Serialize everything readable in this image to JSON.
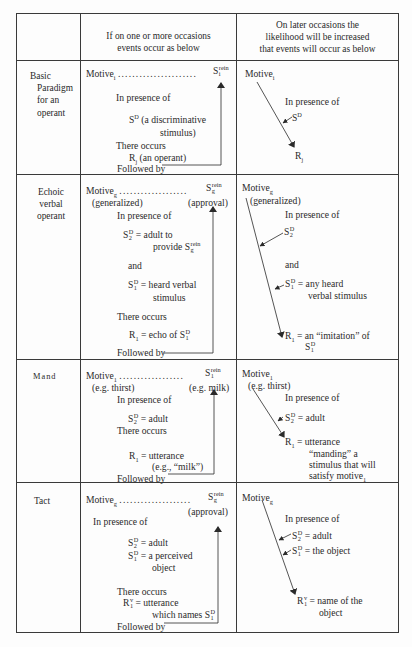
{
  "header": {
    "col1": "",
    "col2": [
      "If on one or more occasions",
      "events occur as below"
    ],
    "col3": [
      "On later occasions the",
      "likelihood will be increased",
      "that events will occur as below"
    ]
  },
  "rows": [
    {
      "label": [
        "Basic",
        "Paradigm",
        "for an",
        "operant"
      ],
      "left": {
        "motive": "Motive",
        "motive_sub": "i",
        "dots": "......................",
        "reinforcer": "S",
        "reinforcer_sup": "rein",
        "reinforcer_sub": "i",
        "in_presence": "In presence of",
        "sd": "S",
        "sd_sup": "D",
        "sd_desc_1": "(a discriminative",
        "sd_desc_2": "stimulus)",
        "there_occurs": "There occurs",
        "r": "R",
        "r_sub": "j",
        "r_desc": "(an operant)",
        "followed_by": "Followed by"
      },
      "right": {
        "motive": "Motive",
        "motive_sub": "i",
        "in_presence": "In presence of",
        "sd": "S",
        "sd_sup": "D",
        "r": "R",
        "r_sub": "j"
      }
    },
    {
      "label": [
        "Echoic",
        "verbal",
        "operant"
      ],
      "left": {
        "motive": "Motive",
        "motive_sub": "g",
        "motive_note": "(generalized)",
        "dots": "...................",
        "reinforcer": "S",
        "reinforcer_sup": "rein",
        "reinforcer_sub": "g",
        "reinforcer_note": "(approval)",
        "in_presence": "In presence of",
        "s2": "S",
        "s2_sup": "D",
        "s2_sub": "2",
        "s2_desc_1": "= adult to",
        "s2_desc_2": "provide S",
        "s2_desc_2_sup": "rein",
        "s2_desc_2_sub": "g",
        "and": "and",
        "s1": "S",
        "s1_sup": "D",
        "s1_sub": "1",
        "s1_desc_1": "= heard verbal",
        "s1_desc_2": "stimulus",
        "there_occurs": "There occurs",
        "r": "R",
        "r_sub": "1",
        "r_desc": "= echo of S",
        "r_desc_sup": "D",
        "r_desc_sub": "1",
        "followed_by": "Followed by"
      },
      "right": {
        "motive": "Motive",
        "motive_sub": "g",
        "motive_note": "(generalized)",
        "in_presence": "In presence of",
        "s2": "S",
        "s2_sup": "D",
        "s2_sub": "2",
        "and": "and",
        "s1": "S",
        "s1_sup": "D",
        "s1_sub": "1",
        "s1_desc_1": "= any heard",
        "s1_desc_2": "verbal stimulus",
        "r": "R",
        "r_sub": "1",
        "r_desc": "= an “imitation” of",
        "r_desc_2": "S",
        "r_desc_2_sup": "D",
        "r_desc_2_sub": "1"
      }
    },
    {
      "label": [
        "Mand"
      ],
      "left": {
        "motive": "Motive",
        "motive_sub": "1",
        "motive_note": "(e.g. thirst)",
        "dots": "..................",
        "reinforcer": "S",
        "reinforcer_sup": "rein",
        "reinforcer_sub": "1",
        "reinforcer_note": "(e.g. milk)",
        "in_presence": "In presence of",
        "s2": "S",
        "s2_sup": "D",
        "s2_sub": "2",
        "s2_desc": "= adult",
        "there_occurs": "There occurs",
        "r": "R",
        "r_sub": "1",
        "r_desc_1": "= utterance",
        "r_desc_2": "(e.g., “milk”)",
        "followed_by": "Followed by"
      },
      "right": {
        "motive": "Motive",
        "motive_sub": "1",
        "motive_note": "(e.g. thirst)",
        "in_presence": "In presence of",
        "s2": "S",
        "s2_sup": "D",
        "s2_sub": "2",
        "s2_desc": "= adult",
        "r": "R",
        "r_sub": "1",
        "r_desc_1": "= utterance",
        "r_desc_2": "“manding” a",
        "r_desc_3": "stimulus that will",
        "r_desc_4": "satisfy motive",
        "r_desc_4_sub": "1"
      }
    },
    {
      "label": [
        "Tact"
      ],
      "left": {
        "motive": "Motive",
        "motive_sub": "g",
        "dots": "....................",
        "reinforcer": "S",
        "reinforcer_sup": "rein",
        "reinforcer_sub": "g",
        "reinforcer_note": "(approval)",
        "in_presence": "In presence of",
        "s2": "S",
        "s2_sup": "D",
        "s2_sub": "2",
        "s2_desc": "= adult",
        "s1": "S",
        "s1_sup": "D",
        "s1_sub": "1",
        "s1_desc_1": "= a perceived",
        "s1_desc_2": "object",
        "there_occurs": "There occurs",
        "r": "R",
        "r_sup": "v",
        "r_sub": "1",
        "r_desc_1": "= utterance",
        "r_desc_2": "which names S",
        "r_desc_2_sup": "D",
        "r_desc_2_sub": "1",
        "followed_by": "Followed by"
      },
      "right": {
        "motive": "Motive",
        "motive_sub": "g",
        "in_presence": "In presence of",
        "s2": "S",
        "s2_sup": "D",
        "s2_sub": "2",
        "s2_desc": "= adult",
        "s1": "S",
        "s1_sup": "D",
        "s1_sub": "1",
        "s1_desc": "= the object",
        "r": "R",
        "r_sup": "v",
        "r_sub": "1",
        "r_desc_1": "= name of the",
        "r_desc_2": "object"
      }
    }
  ]
}
